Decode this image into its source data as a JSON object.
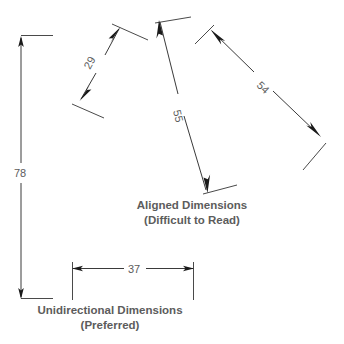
{
  "page": {
    "background_color": "#ffffff",
    "line_color": "#3a3a3a",
    "text_color": "#5c5c5c",
    "width": 344,
    "height": 344
  },
  "captions": {
    "aligned": {
      "title": "Aligned Dimensions",
      "subtitle": "(Difficult to Read)"
    },
    "unidirectional": {
      "title": "Unidirectional Dimensions",
      "subtitle": "(Preferred)"
    }
  },
  "dimensions": {
    "vertical_78": {
      "value": "78",
      "orientation": "vertical",
      "style": "unidirectional"
    },
    "horizontal_37": {
      "value": "37",
      "orientation": "horizontal",
      "style": "unidirectional"
    },
    "aligned_29": {
      "value": "29",
      "orientation": "diagonal",
      "style": "aligned"
    },
    "aligned_55": {
      "value": "55",
      "orientation": "diagonal",
      "style": "aligned"
    },
    "aligned_54": {
      "value": "54",
      "orientation": "diagonal",
      "style": "aligned"
    }
  }
}
